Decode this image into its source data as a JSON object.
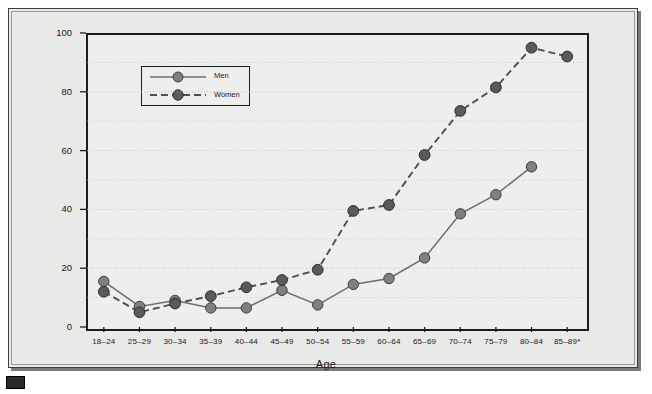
{
  "figure": {
    "x_axis_title": "Age",
    "y_axis_title": "Percent",
    "corner_mark_name": "figure-marker"
  },
  "legend": {
    "position": "top-left",
    "entries": [
      {
        "label": "Men",
        "style": "solid",
        "color": "#808080"
      },
      {
        "label": "Women",
        "style": "dashed",
        "color": "#5a5a5a"
      }
    ]
  },
  "colors": {
    "men_marker": "#808080",
    "women_marker": "#5a5a5a",
    "line": "#6e6e6e",
    "axis": "#1c1c1c",
    "grid": "#b9b9b7",
    "plot_background": "#eeeeec",
    "frame_background": "#e9e9e7"
  },
  "chart_data": {
    "type": "line",
    "title": "",
    "xlabel": "Age",
    "ylabel": "Percent",
    "ylim": [
      0,
      100
    ],
    "yticks": [
      0,
      20,
      40,
      60,
      80,
      100
    ],
    "minor_gridlines": [
      10,
      30,
      50,
      70,
      90
    ],
    "grid": true,
    "legend": "top-left",
    "categories": [
      "18–24",
      "25–29",
      "30–34",
      "35–39",
      "40–44",
      "45–49",
      "50–54",
      "55–59",
      "60–64",
      "65–69",
      "70–74",
      "75–79",
      "80–84",
      "85–89*"
    ],
    "series": [
      {
        "name": "Men",
        "style": "solid",
        "color": "#808080",
        "values": [
          15.5,
          7,
          9,
          6.5,
          6.5,
          12.5,
          7.5,
          14.5,
          16.5,
          23.5,
          38.5,
          45,
          54.5,
          null
        ]
      },
      {
        "name": "Women",
        "style": "dashed",
        "color": "#5a5a5a",
        "values": [
          12,
          5,
          8,
          10.5,
          13.5,
          16,
          19.5,
          39.5,
          41.5,
          58.5,
          73.5,
          81.5,
          95,
          92
        ]
      }
    ]
  }
}
